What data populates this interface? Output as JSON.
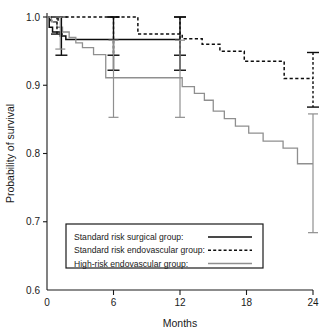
{
  "chart_data": {
    "type": "line",
    "subtype": "kaplan-meier-survival-curve",
    "title": "",
    "xlabel": "Months",
    "ylabel": "Probability of survival",
    "xlim": [
      0,
      24
    ],
    "ylim": [
      0.6,
      1.0
    ],
    "xticks": [
      0,
      6,
      12,
      18,
      24
    ],
    "xticklabels": [
      "0",
      "6",
      "12",
      "18",
      "24"
    ],
    "yticks": [
      0.6,
      0.7,
      0.8,
      0.9,
      1.0
    ],
    "yticklabels": [
      "0.6",
      "0.7",
      "0.8",
      "0.9",
      "1.0"
    ],
    "grid": false,
    "legend_position": "lower-center",
    "series": [
      {
        "name": "Standard risk surgical group:",
        "style": "solid",
        "color": "#0d0d0d",
        "steps": [
          {
            "x": 0.0,
            "y": 1.0
          },
          {
            "x": 0.2,
            "y": 0.985
          },
          {
            "x": 0.5,
            "y": 0.978
          },
          {
            "x": 1.2,
            "y": 0.972
          },
          {
            "x": 1.7,
            "y": 0.967
          },
          {
            "x": 12.0,
            "y": 0.967
          }
        ],
        "end_x": 12.0,
        "end_y": 0.967,
        "error_bars": [
          {
            "x": 1.3,
            "y": 0.972,
            "low": 0.944,
            "high": 1.0
          },
          {
            "x": 6.0,
            "y": 0.967,
            "low": 0.922,
            "high": 1.0
          },
          {
            "x": 12.0,
            "y": 0.967,
            "low": 0.922,
            "high": 1.0
          }
        ]
      },
      {
        "name": "Standard risk endovascular group:",
        "style": "dashed",
        "color": "#0d0d0d",
        "steps": [
          {
            "x": 0.0,
            "y": 1.0
          },
          {
            "x": 0.35,
            "y": 0.995
          },
          {
            "x": 0.6,
            "y": 0.993
          },
          {
            "x": 1.0,
            "y": 1.0
          },
          {
            "x": 8.2,
            "y": 1.0
          },
          {
            "x": 8.2,
            "y": 0.975
          },
          {
            "x": 12.2,
            "y": 0.975
          },
          {
            "x": 12.2,
            "y": 0.968
          },
          {
            "x": 14.0,
            "y": 0.968
          },
          {
            "x": 14.0,
            "y": 0.96
          },
          {
            "x": 15.6,
            "y": 0.96
          },
          {
            "x": 15.6,
            "y": 0.95
          },
          {
            "x": 17.8,
            "y": 0.95
          },
          {
            "x": 17.8,
            "y": 0.935
          },
          {
            "x": 21.4,
            "y": 0.935
          },
          {
            "x": 21.4,
            "y": 0.91
          },
          {
            "x": 24.0,
            "y": 0.91
          }
        ],
        "end_x": 24.0,
        "end_y": 0.91,
        "error_bars": [
          {
            "x": 0.9,
            "y": 0.995,
            "low": 0.975,
            "high": 1.0
          },
          {
            "x": 6.0,
            "y": 1.0,
            "low": 0.944,
            "high": 1.0
          },
          {
            "x": 12.0,
            "y": 0.975,
            "low": 0.944,
            "high": 1.0
          },
          {
            "x": 24.0,
            "y": 0.91,
            "low": 0.868,
            "high": 0.948
          }
        ]
      },
      {
        "name": "High-risk endovascular group:",
        "style": "solid",
        "color": "#8f8f8f",
        "steps": [
          {
            "x": 0.0,
            "y": 1.0
          },
          {
            "x": 0.4,
            "y": 0.993
          },
          {
            "x": 0.9,
            "y": 0.985
          },
          {
            "x": 1.4,
            "y": 0.978
          },
          {
            "x": 2.0,
            "y": 0.97
          },
          {
            "x": 2.6,
            "y": 0.962
          },
          {
            "x": 3.2,
            "y": 0.955
          },
          {
            "x": 4.2,
            "y": 0.945
          },
          {
            "x": 5.3,
            "y": 0.945
          },
          {
            "x": 5.3,
            "y": 0.911
          },
          {
            "x": 12.2,
            "y": 0.911
          },
          {
            "x": 12.2,
            "y": 0.898
          },
          {
            "x": 13.3,
            "y": 0.898
          },
          {
            "x": 13.3,
            "y": 0.888
          },
          {
            "x": 14.2,
            "y": 0.888
          },
          {
            "x": 14.2,
            "y": 0.878
          },
          {
            "x": 15.0,
            "y": 0.878
          },
          {
            "x": 15.0,
            "y": 0.862
          },
          {
            "x": 16.0,
            "y": 0.862
          },
          {
            "x": 16.0,
            "y": 0.851
          },
          {
            "x": 17.0,
            "y": 0.851
          },
          {
            "x": 17.0,
            "y": 0.84
          },
          {
            "x": 18.2,
            "y": 0.84
          },
          {
            "x": 18.2,
            "y": 0.83
          },
          {
            "x": 19.5,
            "y": 0.83
          },
          {
            "x": 19.5,
            "y": 0.818
          },
          {
            "x": 21.3,
            "y": 0.818
          },
          {
            "x": 21.3,
            "y": 0.808
          },
          {
            "x": 22.6,
            "y": 0.808
          },
          {
            "x": 22.6,
            "y": 0.785
          },
          {
            "x": 24.0,
            "y": 0.785
          }
        ],
        "end_x": 24.0,
        "end_y": 0.785,
        "error_bars": [
          {
            "x": 1.2,
            "y": 0.978,
            "low": 0.953,
            "high": 1.0
          },
          {
            "x": 6.0,
            "y": 0.911,
            "low": 0.853,
            "high": 0.966
          },
          {
            "x": 12.0,
            "y": 0.911,
            "low": 0.853,
            "high": 0.966
          },
          {
            "x": 24.0,
            "y": 0.785,
            "low": 0.684,
            "high": 0.858
          }
        ]
      }
    ]
  },
  "legend": {
    "entries": [
      {
        "label": "Standard risk surgical group:",
        "style": "solid-black"
      },
      {
        "label": "Standard risk endovascular group:",
        "style": "dashed-black"
      },
      {
        "label": "High-risk endovascular group:",
        "style": "solid-grey"
      }
    ]
  },
  "axes": {
    "x_title": "Months",
    "y_title": "Probability of survival"
  }
}
